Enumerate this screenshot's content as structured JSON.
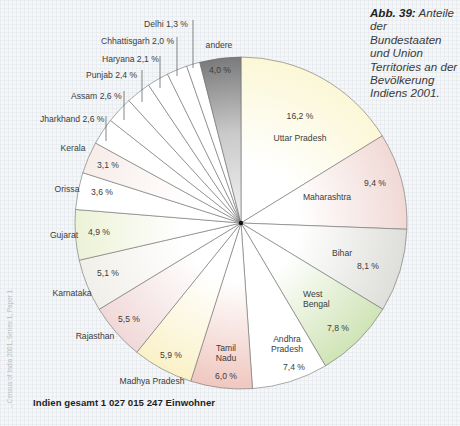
{
  "caption": {
    "figure_label": "Abb. 39:",
    "text": "Anteile der Bundestaaten und Union Territories an der Bevölkerung Indiens 2001."
  },
  "footer": {
    "total": "Indien gesamt 1 027 015 247 Einwohner",
    "source_vertical": "...Census of India 2001, Series 1, Paper 1"
  },
  "chart_data": {
    "type": "pie",
    "title": "Anteile der Bundestaaten und Union Territories an der Bevölkerung Indiens 2001",
    "start_angle_deg": 0,
    "direction": "clockwise",
    "total_population": "1 027 015 247",
    "unit": "%",
    "slices": [
      {
        "name": "Uttar Pradesh",
        "value": 16.2,
        "label": "16,2 %",
        "color": "#fbf7d6",
        "label_name": [
          300,
          141
        ],
        "label_value": [
          300,
          119
        ],
        "anchor": "middle"
      },
      {
        "name": "Maharashtra",
        "value": 9.4,
        "label": "9,4 %",
        "color": "#f1d9d5",
        "label_name": [
          327,
          200
        ],
        "label_value": [
          375,
          186
        ],
        "anchor": "middle"
      },
      {
        "name": "Bihar",
        "value": 8.1,
        "label": "8,1 %",
        "color": "#dededa",
        "label_name": [
          342,
          256
        ],
        "label_value": [
          368,
          269
        ],
        "anchor": "middle"
      },
      {
        "name": "West Bengal",
        "value": 7.8,
        "label": "7,8 %",
        "color": "#cfe4b6",
        "label_name": [
          303,
          297
        ],
        "label_name2": "Bengal",
        "label_value": [
          338,
          331
        ],
        "anchor": "start",
        "multiline": [
          "West",
          "Bengal"
        ]
      },
      {
        "name": "Andhra Pradesh",
        "value": 7.4,
        "label": "7,4 %",
        "color": "#ffffff",
        "label_name": [
          287,
          342
        ],
        "label_value": [
          294,
          370
        ],
        "anchor": "middle",
        "multiline": [
          "Andhra",
          "Pradesh"
        ]
      },
      {
        "name": "Tamil Nadu",
        "value": 6.0,
        "label": "6,0 %",
        "color": "#efc7bf",
        "label_name": [
          226,
          351
        ],
        "label_value": [
          226,
          379
        ],
        "anchor": "middle",
        "multiline": [
          "Tamil",
          "Nadu"
        ]
      },
      {
        "name": "Madhya Pradesh",
        "value": 5.9,
        "label": "5,9 %",
        "color": "#faf1c8",
        "label_name": [
          152,
          384
        ],
        "label_value": [
          171,
          358
        ],
        "anchor": "middle"
      },
      {
        "name": "Rajasthan",
        "value": 5.5,
        "label": "5,5 %",
        "color": "#f1d8d8",
        "label_name": [
          95,
          339
        ],
        "label_value": [
          129,
          322
        ],
        "anchor": "middle"
      },
      {
        "name": "Karnataka",
        "value": 5.1,
        "label": "5,1 %",
        "color": "#f1efe9",
        "label_name": [
          72,
          296
        ],
        "label_value": [
          108,
          276
        ],
        "anchor": "middle"
      },
      {
        "name": "Gujarat",
        "value": 4.9,
        "label": "4,9 %",
        "color": "#ecf2d6",
        "label_name": [
          64,
          238
        ],
        "label_value": [
          99,
          235
        ],
        "anchor": "middle"
      },
      {
        "name": "Orissa",
        "value": 3.6,
        "label": "3,6 %",
        "color": "#ffffff",
        "label_name": [
          67,
          192
        ],
        "label_value": [
          102,
          195
        ],
        "anchor": "middle"
      },
      {
        "name": "Kerala",
        "value": 3.1,
        "label": "3,1 %",
        "color": "#f7ece8",
        "label_name": [
          73,
          151
        ],
        "label_value": [
          108,
          168
        ],
        "anchor": "middle"
      },
      {
        "name": "Jharkhand",
        "value": 2.6,
        "label": "2,6 %",
        "color": "#ffffff",
        "label_name": [
          40,
          122
        ],
        "anchor": "start",
        "leader": [
          106,
          116,
          106,
          141
        ]
      },
      {
        "name": "Assam",
        "value": 2.6,
        "label": "2,6 %",
        "color": "#ffffff",
        "label_name": [
          71,
          99
        ],
        "anchor": "start",
        "leader": [
          124,
          91,
          124,
          120
        ]
      },
      {
        "name": "Punjab",
        "value": 2.4,
        "label": "2,4 %",
        "color": "#ffffff",
        "label_name": [
          86,
          78
        ],
        "anchor": "start",
        "leader": [
          142,
          70,
          142,
          102
        ]
      },
      {
        "name": "Haryana",
        "value": 2.1,
        "label": "2,1 %",
        "color": "#ffffff",
        "label_name": [
          102,
          62
        ],
        "anchor": "start",
        "leader": [
          160,
          56,
          160,
          88
        ]
      },
      {
        "name": "Chhattisgarh",
        "value": 2.0,
        "label": "2,0 %",
        "color": "#ffffff",
        "label_name": [
          101,
          44
        ],
        "anchor": "start",
        "leader": [
          177,
          37,
          177,
          76
        ]
      },
      {
        "name": "Delhi",
        "value": 1.3,
        "label": "1,3 %",
        "color": "#ffffff",
        "label_name": [
          144,
          27
        ],
        "anchor": "start",
        "leader": [
          193,
          20,
          193,
          68
        ]
      },
      {
        "name": "andere",
        "value": 4.0,
        "label": "4,0 %",
        "color": "#7a7a7a",
        "label_name": [
          219,
          48
        ],
        "label_value": [
          220,
          73
        ],
        "anchor": "middle",
        "gradient": true
      }
    ],
    "legend": "none",
    "geometry": {
      "cx": 241,
      "cy": 223,
      "r": 166
    }
  }
}
